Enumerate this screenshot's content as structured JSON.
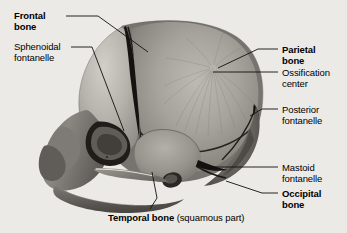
{
  "figure": {
    "background_color": "#eceae6",
    "leader_line_color": "#111111"
  },
  "labels": [
    {
      "id": "frontal-bone",
      "lines": [
        "Frontal",
        "bone"
      ],
      "bold": true,
      "side": "left",
      "x": 14,
      "y": 10,
      "leader": [
        [
          66,
          16
        ],
        [
          98,
          16
        ],
        [
          148,
          52
        ]
      ]
    },
    {
      "id": "sphenoidal-fontanelle",
      "lines": [
        "Sphenoidal",
        "fontanelle"
      ],
      "bold": false,
      "side": "left",
      "x": 14,
      "y": 41,
      "leader": [
        [
          71,
          47
        ],
        [
          92,
          47
        ],
        [
          124,
          131
        ]
      ]
    },
    {
      "id": "parietal-bone",
      "lines": [
        "Parietal",
        "bone"
      ],
      "bold": true,
      "side": "right",
      "x": 282,
      "y": 44,
      "leader": [
        [
          278,
          49
        ],
        [
          258,
          49
        ],
        [
          218,
          68
        ]
      ]
    },
    {
      "id": "ossification-center",
      "lines": [
        "Ossification",
        "center"
      ],
      "bold": false,
      "side": "right",
      "x": 282,
      "y": 67,
      "leader": [
        [
          278,
          72
        ],
        [
          213,
          72
        ]
      ]
    },
    {
      "id": "posterior-fontanelle",
      "lines": [
        "Posterior",
        "fontanelle"
      ],
      "bold": false,
      "side": "right",
      "x": 282,
      "y": 104,
      "leader": [
        [
          278,
          109
        ],
        [
          262,
          109
        ],
        [
          250,
          116
        ]
      ]
    },
    {
      "id": "mastoid-fontanelle",
      "lines": [
        "Mastoid",
        "fontanelle"
      ],
      "bold": false,
      "side": "right",
      "x": 282,
      "y": 162,
      "leader": [
        [
          278,
          167
        ],
        [
          210,
          167
        ]
      ]
    },
    {
      "id": "occipital-bone",
      "lines": [
        "Occipital",
        "bone"
      ],
      "bold": true,
      "side": "right",
      "x": 282,
      "y": 188,
      "leader": [
        [
          278,
          193
        ],
        [
          262,
          193
        ],
        [
          226,
          181
        ]
      ]
    }
  ],
  "caption": {
    "id": "temporal-bone",
    "bold_text": "Temporal bone",
    "normal_text": " (squamous part)",
    "x": 108,
    "y": 212,
    "leader": [
      [
        150,
        209
      ],
      [
        157,
        198
      ],
      [
        152,
        172
      ]
    ]
  },
  "anatomy_regions": [
    {
      "name": "frontal-bone-region",
      "shade": "#b9b6b0"
    },
    {
      "name": "parietal-bone-region",
      "shade": "#9b9892"
    },
    {
      "name": "temporal-bone-region",
      "shade": "#8d8a85"
    },
    {
      "name": "occipital-bone-region",
      "shade": "#6e6b67"
    },
    {
      "name": "facial-bones-region",
      "shade": "#7d7a75"
    },
    {
      "name": "mandible-region",
      "shade": "#6a6762"
    },
    {
      "name": "anterior-fontanelle-suture",
      "shade": "#14120f"
    }
  ]
}
